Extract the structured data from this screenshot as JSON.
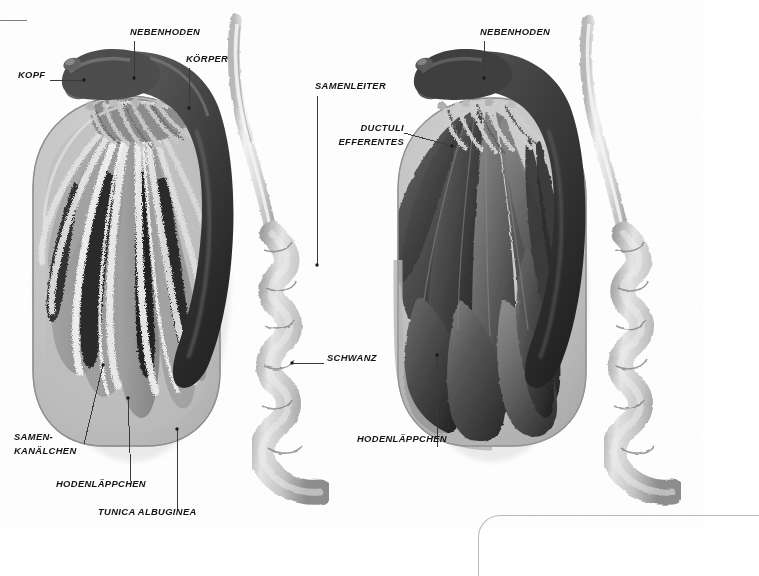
{
  "figure": {
    "background_color": "#ffffff",
    "frame_color": "#8c8c8c",
    "label_color": "#141414",
    "leader_color": "#3a3a3a"
  },
  "palette": {
    "epididymis_dark": "#4a4a4a",
    "epididymis_darker": "#2e2e2e",
    "vas_deferens_light": "#d8d8d8",
    "tunica_light": "#c9c9c9",
    "tunica_mid": "#b0b0b0",
    "lobule_mid": "#9a9a9a",
    "lobule_dark": "#3c3c3c",
    "tubule_light": "#efefef",
    "lobule_solid": "#5a5a5a",
    "lobule_solid_dark": "#333333",
    "shadow": "#e3e3e3"
  },
  "panels": [
    {
      "id": "left-panel",
      "name": "sectioned-testis-panel",
      "description": "Hoden im Längsschnitt mit Samenkanälchen",
      "labels": [
        {
          "id": "kopf",
          "text": "KOPF",
          "x": 18,
          "y": 74,
          "align": "left",
          "leader": {
            "type": "h",
            "x1": 50,
            "y1": 80,
            "x2": 84,
            "y2": 80
          },
          "dot": {
            "x": 84,
            "y": 80
          }
        },
        {
          "id": "nebenhoden",
          "text": "NEBENHODEN",
          "x": 130,
          "y": 31,
          "align": "left",
          "leader": {
            "type": "v",
            "x1": 134,
            "y1": 40,
            "x2": 134,
            "y2": 78
          },
          "dot": {
            "x": 134,
            "y": 78
          }
        },
        {
          "id": "koerper",
          "text": "KÖRPER",
          "x": 186,
          "y": 58,
          "align": "left",
          "leader": {
            "type": "v",
            "x1": 189,
            "y1": 68,
            "x2": 189,
            "y2": 108
          },
          "dot": {
            "x": 189,
            "y": 108
          }
        },
        {
          "id": "samenleiter",
          "text": "SAMENLEITER",
          "x": 315,
          "y": 85,
          "align": "left",
          "leader": {
            "type": "v",
            "x1": 317,
            "y1": 95,
            "x2": 317,
            "y2": 265
          },
          "dot": {
            "x": 317,
            "y": 265
          }
        },
        {
          "id": "schwanz",
          "text": "SCHWANZ",
          "x": 327,
          "y": 357,
          "align": "left",
          "leader": {
            "type": "h",
            "x1": 292,
            "y1": 363,
            "x2": 324,
            "y2": 363
          },
          "dot": {
            "x": 292,
            "y": 363
          }
        },
        {
          "id": "samen-kanaelchen",
          "text": "SAMEN-\nKANÄLCHEN",
          "x": 14,
          "y": 436,
          "align": "left",
          "leader": {
            "type": "diag",
            "x1": 84,
            "y1": 444,
            "x2": 103,
            "y2": 365
          },
          "dot": {
            "x": 103,
            "y": 365
          }
        },
        {
          "id": "hodenlaeppchen-left",
          "text": "HODENLÄPPCHEN",
          "x": 56,
          "y": 483,
          "align": "left",
          "leader": {
            "type": "diag",
            "x1": 131,
            "y1": 484,
            "x2": 128,
            "y2": 398
          },
          "dot": {
            "x": 128,
            "y": 398
          }
        },
        {
          "id": "tunica-albuginea",
          "text": "TUNICA ALBUGINEA",
          "x": 98,
          "y": 511,
          "align": "left",
          "leader": {
            "type": "v",
            "x1": 177,
            "y1": 429,
            "x2": 177,
            "y2": 509
          },
          "dot": {
            "x": 177,
            "y": 429
          }
        }
      ]
    },
    {
      "id": "right-panel",
      "name": "intact-testis-panel",
      "description": "Hoden mit freipräparierten Hodenläppchen",
      "labels": [
        {
          "id": "nebenhoden-right",
          "text": "NEBENHODEN",
          "x": 480,
          "y": 31,
          "align": "left",
          "leader": {
            "type": "v",
            "x1": 484,
            "y1": 40,
            "x2": 484,
            "y2": 78
          },
          "dot": {
            "x": 484,
            "y": 78
          }
        },
        {
          "id": "ductuli-efferentes",
          "text": "DUCTULI\nEFFERENTES",
          "x": 327,
          "y": 127,
          "align": "right",
          "leader": {
            "type": "diag",
            "x1": 404,
            "y1": 133,
            "x2": 452,
            "y2": 146
          },
          "dot": {
            "x": 452,
            "y": 146
          }
        },
        {
          "id": "hodenlaeppchen-right",
          "text": "HODENLÄPPCHEN",
          "x": 357,
          "y": 438,
          "align": "left",
          "leader": {
            "type": "v",
            "x1": 437,
            "y1": 355,
            "x2": 437,
            "y2": 447
          },
          "dot": {
            "x": 437,
            "y": 355
          }
        }
      ]
    }
  ]
}
